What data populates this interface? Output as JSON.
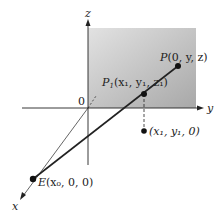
{
  "axes": {
    "x_label": "x",
    "y_label": "y",
    "z_label": "z",
    "origin_label": "0"
  },
  "points": {
    "P": {
      "name": "P",
      "coords": "(0, y, z)"
    },
    "P1": {
      "name": "P",
      "sub": "1",
      "coords": "(x₁, y₁, z₁)"
    },
    "proj": {
      "coords": "(x₁, y₁, 0)"
    },
    "E": {
      "name": "E",
      "coords": "(x₀, 0, 0)"
    }
  },
  "colors": {
    "plane_light": "#e6e6e6",
    "plane_dark": "#a9a9a9",
    "line": "#222222"
  }
}
